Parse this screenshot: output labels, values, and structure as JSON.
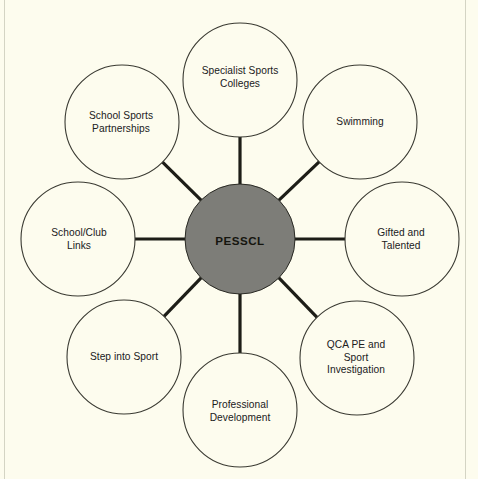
{
  "diagram": {
    "type": "hub-and-spoke",
    "background_color": "#fdfcee",
    "hub": {
      "label": "PESSCL",
      "fill_color": "#7d7d78",
      "stroke_color": "#2a2a24",
      "center_x": 240,
      "center_y": 239,
      "radius": 55
    },
    "node_style": {
      "fill_color": "#fdfcee",
      "stroke_color": "#3a3a32",
      "stroke_width": 1.1,
      "radius": 57
    },
    "spoke_style": {
      "color": "#1d1d17",
      "width": 3.2
    },
    "orbit_radius": 127,
    "nodes": [
      {
        "id": "specialist-sports-colleges",
        "label": "Specialist Sports\nColleges",
        "angle_deg": -90,
        "center_x": 240,
        "center_y": 80,
        "label_x": 240,
        "label_y": 78
      },
      {
        "id": "swimming",
        "label": "Swimming",
        "angle_deg": -45,
        "center_x": 360,
        "center_y": 122,
        "label_x": 360,
        "label_y": 122
      },
      {
        "id": "gifted-and-talented",
        "label": "Gifted and\nTalented",
        "angle_deg": 0,
        "center_x": 402,
        "center_y": 239,
        "label_x": 401,
        "label_y": 240
      },
      {
        "id": "qca-pe-and-sport-investigation",
        "label": "QCA PE and\nSport\nInvestigation",
        "angle_deg": 45,
        "center_x": 357,
        "center_y": 358,
        "label_x": 356,
        "label_y": 358
      },
      {
        "id": "professional-development",
        "label": "Professional\nDevelopment",
        "angle_deg": 90,
        "center_x": 240,
        "center_y": 410,
        "label_x": 240,
        "label_y": 412
      },
      {
        "id": "step-into-sport",
        "label": "Step into Sport",
        "angle_deg": 135,
        "center_x": 124,
        "center_y": 357
      },
      {
        "id": "school-club-links",
        "label": "School/Club\nLinks",
        "angle_deg": 180,
        "center_x": 78,
        "center_y": 239,
        "label_x": 79,
        "label_y": 240
      },
      {
        "id": "school-sports-partnerships",
        "label": "School Sports\nPartnerships",
        "angle_deg": -135,
        "center_x": 122,
        "center_y": 122,
        "label_x": 121,
        "label_y": 123
      }
    ]
  }
}
